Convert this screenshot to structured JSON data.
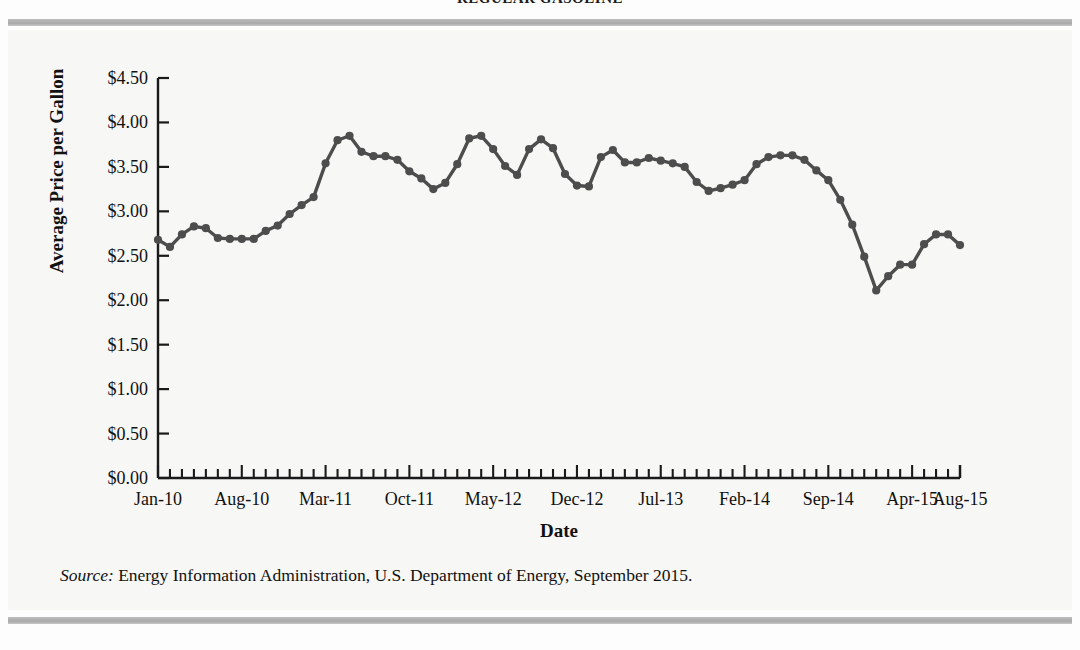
{
  "figure": {
    "title": "REGULAR GASOLINE",
    "source_prefix": "Source:",
    "source_text": " Energy Information Administration, U.S. Department of Energy, September 2015."
  },
  "chart_data": {
    "type": "line",
    "title": "REGULAR GASOLINE",
    "xlabel": "Date",
    "ylabel": "Average Price per Gallon",
    "ylim": [
      0,
      4.5
    ],
    "ytick_values": [
      0,
      0.5,
      1.0,
      1.5,
      2.0,
      2.5,
      3.0,
      3.5,
      4.0,
      4.5
    ],
    "ytick_labels": [
      "$0.00",
      "$0.50",
      "$1.00",
      "$1.50",
      "$2.00",
      "$2.50",
      "$3.00",
      "$3.50",
      "$4.00",
      "$4.50"
    ],
    "xtick_labels": [
      "Jan-10",
      "Aug-10",
      "Mar-11",
      "Oct-11",
      "May-12",
      "Dec-12",
      "Jul-13",
      "Feb-14",
      "Sep-14",
      "Apr-15",
      "Aug-15"
    ],
    "xtick_indices": [
      0,
      7,
      14,
      21,
      28,
      35,
      42,
      49,
      56,
      63,
      67
    ],
    "minor_tick_interval_months": 1,
    "grid": false,
    "legend": null,
    "marker": "circle",
    "line_color": "#4d4d4d",
    "x": [
      "Jan-10",
      "Feb-10",
      "Mar-10",
      "Apr-10",
      "May-10",
      "Jun-10",
      "Jul-10",
      "Aug-10",
      "Sep-10",
      "Oct-10",
      "Nov-10",
      "Dec-10",
      "Jan-11",
      "Feb-11",
      "Mar-11",
      "Apr-11",
      "May-11",
      "Jun-11",
      "Jul-11",
      "Aug-11",
      "Sep-11",
      "Oct-11",
      "Nov-11",
      "Dec-11",
      "Jan-12",
      "Feb-12",
      "Mar-12",
      "Apr-12",
      "May-12",
      "Jun-12",
      "Jul-12",
      "Aug-12",
      "Sep-12",
      "Oct-12",
      "Nov-12",
      "Dec-12",
      "Jan-13",
      "Feb-13",
      "Mar-13",
      "Apr-13",
      "May-13",
      "Jun-13",
      "Jul-13",
      "Aug-13",
      "Sep-13",
      "Oct-13",
      "Nov-13",
      "Dec-13",
      "Jan-14",
      "Feb-14",
      "Mar-14",
      "Apr-14",
      "May-14",
      "Jun-14",
      "Jul-14",
      "Aug-14",
      "Sep-14",
      "Oct-14",
      "Nov-14",
      "Dec-14",
      "Jan-15",
      "Feb-15",
      "Mar-15",
      "Apr-15",
      "May-15",
      "Jun-15",
      "Jul-15",
      "Aug-15"
    ],
    "values": [
      2.68,
      2.6,
      2.74,
      2.83,
      2.81,
      2.7,
      2.69,
      2.69,
      2.69,
      2.78,
      2.84,
      2.97,
      3.07,
      3.16,
      3.54,
      3.8,
      3.85,
      3.67,
      3.62,
      3.62,
      3.58,
      3.45,
      3.37,
      3.25,
      3.32,
      3.53,
      3.82,
      3.85,
      3.7,
      3.51,
      3.41,
      3.7,
      3.81,
      3.71,
      3.42,
      3.29,
      3.28,
      3.61,
      3.69,
      3.55,
      3.55,
      3.6,
      3.57,
      3.54,
      3.5,
      3.33,
      3.23,
      3.26,
      3.3,
      3.35,
      3.53,
      3.61,
      3.63,
      3.63,
      3.58,
      3.46,
      3.35,
      3.13,
      2.85,
      2.49,
      2.11,
      2.27,
      2.4,
      2.4,
      2.63,
      2.74,
      2.74,
      2.62
    ]
  }
}
